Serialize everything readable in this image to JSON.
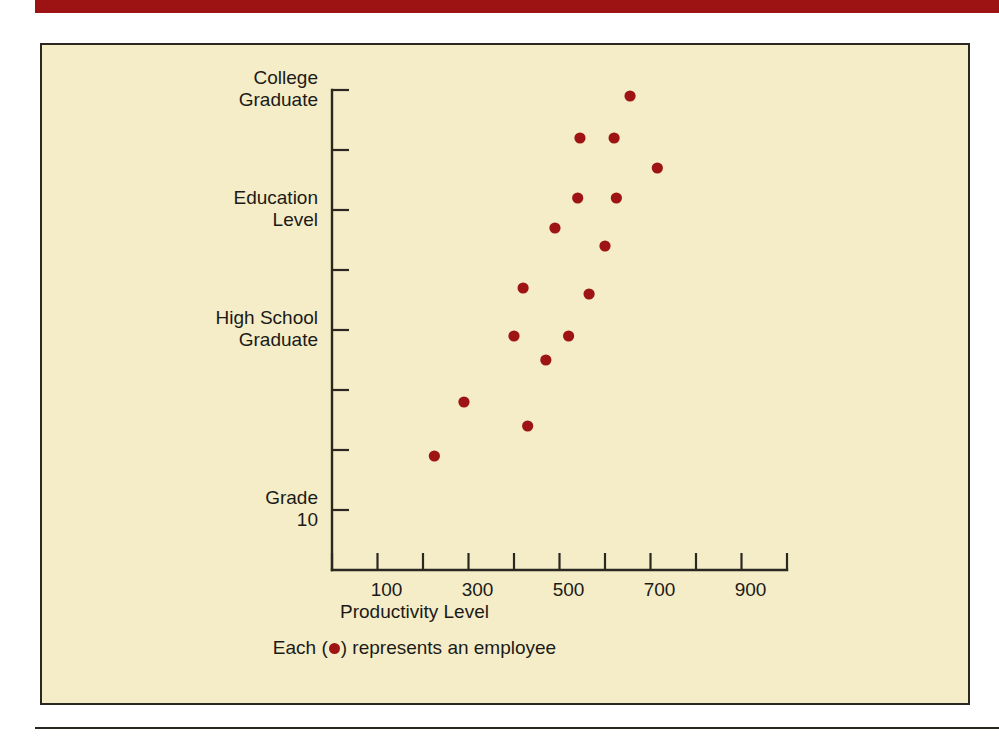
{
  "page": {
    "background_color": "#ffffff",
    "banner_color": "#9d1212",
    "panel_background_color": "#f4edc8",
    "ink_color": "#1c1a17",
    "marker_color": "#9e1414"
  },
  "caption": {
    "prefix": "Each (",
    "dot_icon": "red-dot-icon",
    "suffix": ") represents an employee"
  },
  "chart_data": {
    "type": "scatter",
    "title": "",
    "xlabel": "Productivity Level",
    "ylabel": "Education Level",
    "xlim": [
      0,
      1000
    ],
    "ylim": [
      0,
      8
    ],
    "grid": false,
    "legend": "Each ( ● ) represents an employee",
    "legend_position": "below-axis",
    "x_ticks": [
      0,
      100,
      200,
      300,
      400,
      500,
      600,
      700,
      800,
      900,
      1000
    ],
    "x_tick_labels": [
      "",
      "100",
      "",
      "300",
      "",
      "500",
      "",
      "700",
      "",
      "900",
      ""
    ],
    "y_ticks": [
      0,
      1,
      2,
      3,
      4,
      5,
      6,
      7,
      8
    ],
    "y_tick_labels": [
      "",
      "Grade\n10",
      "",
      "",
      "High School\nGraduate",
      "",
      "Education\nLevel",
      "",
      "College\nGraduate"
    ],
    "y_category_labels": [
      {
        "value": 8,
        "label": "College\nGraduate"
      },
      {
        "value": 6,
        "label": "Education\nLevel"
      },
      {
        "value": 4,
        "label": "High School\nGraduate"
      },
      {
        "value": 1,
        "label": "Grade\n10"
      }
    ],
    "points": [
      {
        "x": 225,
        "y": 1.9
      },
      {
        "x": 290,
        "y": 2.8
      },
      {
        "x": 400,
        "y": 3.9
      },
      {
        "x": 430,
        "y": 2.4
      },
      {
        "x": 420,
        "y": 4.7
      },
      {
        "x": 470,
        "y": 3.5
      },
      {
        "x": 490,
        "y": 5.7
      },
      {
        "x": 520,
        "y": 3.9
      },
      {
        "x": 540,
        "y": 6.2
      },
      {
        "x": 545,
        "y": 7.2
      },
      {
        "x": 565,
        "y": 4.6
      },
      {
        "x": 600,
        "y": 5.4
      },
      {
        "x": 620,
        "y": 7.2
      },
      {
        "x": 625,
        "y": 6.2
      },
      {
        "x": 655,
        "y": 7.9
      },
      {
        "x": 715,
        "y": 6.7
      }
    ],
    "series_name": "employee",
    "n_points": 16
  }
}
